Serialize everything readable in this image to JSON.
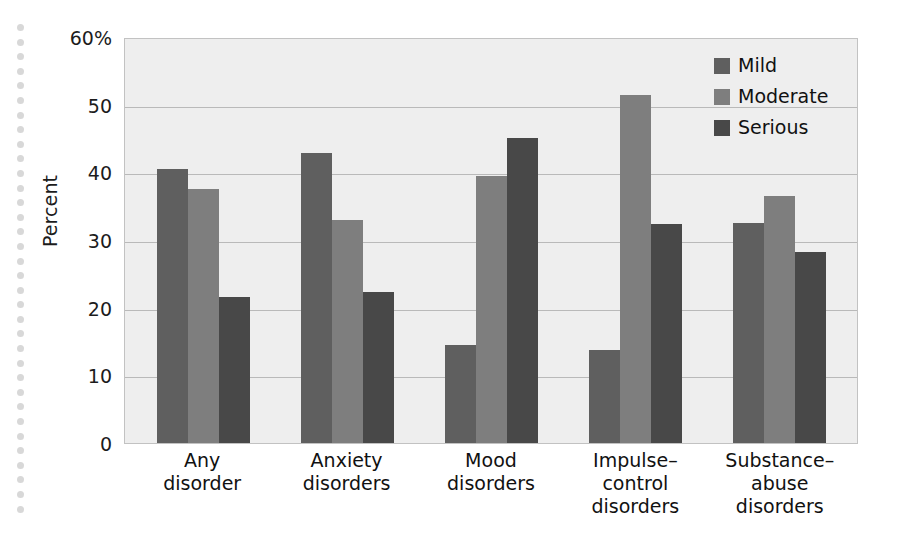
{
  "chart_data": {
    "type": "bar",
    "title": "",
    "subtitle": "",
    "xlabel": "",
    "ylabel": "Percent",
    "ylim": [
      0,
      60
    ],
    "grid": true,
    "legend_position": "top-right",
    "y_ticks": [
      {
        "value": 60,
        "label": "60%"
      },
      {
        "value": 50,
        "label": "50"
      },
      {
        "value": 40,
        "label": "40"
      },
      {
        "value": 30,
        "label": "30"
      },
      {
        "value": 20,
        "label": "20"
      },
      {
        "value": 10,
        "label": "10"
      },
      {
        "value": 0,
        "label": "0"
      }
    ],
    "categories": [
      "Any\ndisorder",
      "Anxiety\ndisorders",
      "Mood\ndisorders",
      "Impulse–\ncontrol\ndisorders",
      "Substance–\nabuse\ndisorders"
    ],
    "series": [
      {
        "name": "Mild",
        "color": "#5f5f5f",
        "values": [
          40.5,
          42.8,
          14.5,
          13.8,
          32.5
        ]
      },
      {
        "name": "Moderate",
        "color": "#7e7e7e",
        "values": [
          37.5,
          33.0,
          39.5,
          51.5,
          36.5
        ]
      },
      {
        "name": "Serious",
        "color": "#484848",
        "values": [
          21.6,
          22.3,
          45.1,
          32.4,
          28.3
        ]
      }
    ]
  },
  "colors": {
    "mild": "#5f5f5f",
    "moderate": "#7e7e7e",
    "serious": "#484848",
    "plot_background": "#eeeeee",
    "gridline": "#b9b9b9",
    "plot_border": "#c2c2c2",
    "page_background": "#ffffff",
    "text": "#111111",
    "rail_dot": "#d8d8d8"
  },
  "legend": {
    "items": [
      {
        "label": "Mild",
        "color": "#5f5f5f"
      },
      {
        "label": "Moderate",
        "color": "#7e7e7e"
      },
      {
        "label": "Serious",
        "color": "#484848"
      }
    ]
  },
  "decoration": {
    "dot_rail_count": 34
  }
}
